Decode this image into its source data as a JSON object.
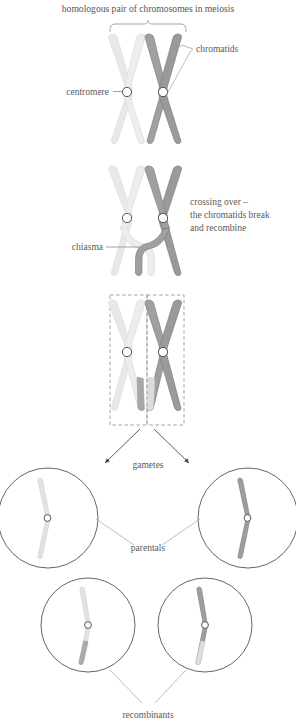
{
  "figure": {
    "title": "homologous pair of chromosomes in meiosis"
  },
  "labels": {
    "title": "homologous pair of chromosomes in meiosis",
    "centromere": "centromere",
    "chromatids": "chromatids",
    "chiasma": "chiasma",
    "crossing_over_line1": "crossing over –",
    "crossing_over_line2": "the chromatids break",
    "crossing_over_line3": "and recombine",
    "gametes": "gametes",
    "parentals": "parentals",
    "recombinants": "recombinants"
  },
  "colors": {
    "light_chromosome": "#e8e8e8",
    "light_chromosome_stroke": "#d8d8d8",
    "light_chromosome_inner": "#f4f4f4",
    "dark_chromosome": "#9a9a9a",
    "dark_chromosome_stroke": "#7e7e7e",
    "dark_chromosome_inner": "#b4b4b4",
    "centromere_fill": "#ffffff",
    "centromere_stroke": "#444444",
    "text": "#5a5a5a",
    "leader_line": "#a8a8a8",
    "dashed_box": "#8a8a8a",
    "arrow": "#4a4a4a",
    "circle_stroke": "#555555",
    "background": "#ffffff"
  },
  "stages": [
    {
      "id": "stage-1",
      "name": "paired homologous chromosomes",
      "description": "two X-shaped chromosomes, one light one dark, side by side with bracket above"
    },
    {
      "id": "stage-2",
      "name": "crossing over with chiasma",
      "description": "inner chromatids break and recombine forming a chiasma"
    },
    {
      "id": "stage-3",
      "name": "recombined chromosomes separating",
      "description": "each chromosome now carries an exchanged segment, enclosed in dashed boxes"
    },
    {
      "id": "stage-4",
      "name": "four gametes",
      "description": "four circular gametes: two parental, two recombinant"
    }
  ],
  "gametes": [
    {
      "id": "gamete-parental-left",
      "type": "parental",
      "chromosome": "light",
      "tip": "none"
    },
    {
      "id": "gamete-parental-right",
      "type": "parental",
      "chromosome": "dark",
      "tip": "none"
    },
    {
      "id": "gamete-recombinant-left",
      "type": "recombinant",
      "chromosome": "light",
      "tip": "dark-lower"
    },
    {
      "id": "gamete-recombinant-right",
      "type": "recombinant",
      "chromosome": "dark",
      "tip": "light-lower"
    }
  ]
}
